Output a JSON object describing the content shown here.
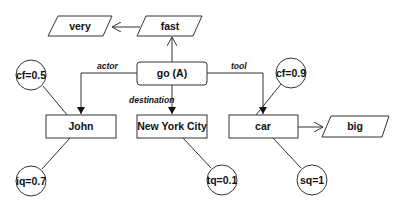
{
  "diagram": {
    "type": "conceptual-graph",
    "colors": {
      "stroke": "#333333",
      "fill": "#ffffff",
      "text": "#111111"
    },
    "nodes": {
      "very": {
        "label": "very",
        "shape": "parallelogram"
      },
      "fast": {
        "label": "fast",
        "shape": "parallelogram"
      },
      "go": {
        "label": "go (A)",
        "shape": "rounded-rectangle"
      },
      "john": {
        "label": "John",
        "shape": "rectangle"
      },
      "nyc": {
        "label": "New York City",
        "shape": "rectangle"
      },
      "car": {
        "label": "car",
        "shape": "rectangle"
      },
      "big": {
        "label": "big",
        "shape": "parallelogram"
      },
      "cf05": {
        "label": "cf=0.5",
        "shape": "circle"
      },
      "cf09": {
        "label": "cf=0.9",
        "shape": "circle"
      },
      "iq07": {
        "label": "iq=0.7",
        "shape": "circle"
      },
      "tq01": {
        "label": "tq=0.1",
        "shape": "circle"
      },
      "sq1": {
        "label": "sq=1",
        "shape": "circle"
      }
    },
    "edges": {
      "actor": {
        "label": "actor",
        "from": "go (A)",
        "to": "John"
      },
      "destination": {
        "label": "destination",
        "from": "go (A)",
        "to": "New York City"
      },
      "tool": {
        "label": "tool",
        "from": "go (A)",
        "to": "car"
      },
      "go_fast": {
        "label": "",
        "from": "go (A)",
        "to": "fast"
      },
      "fast_very": {
        "label": "",
        "from": "fast",
        "to": "very"
      },
      "car_big": {
        "label": "",
        "from": "car",
        "to": "big"
      }
    }
  }
}
